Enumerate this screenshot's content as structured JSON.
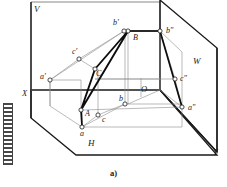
{
  "figure": {
    "caption": "a)",
    "type": "descriptive-geometry-three-plane-projection",
    "planes": [
      {
        "id": "V",
        "label": "V",
        "name": "vertical-frontal-plane",
        "x": 34,
        "y": 12
      },
      {
        "id": "W",
        "label": "W",
        "name": "profile-plane",
        "x": 193,
        "y": 64
      },
      {
        "id": "H",
        "label": "H",
        "name": "horizontal-plane",
        "x": 88,
        "y": 146
      }
    ],
    "axes": [
      {
        "id": "X",
        "label": "X",
        "x": 22,
        "y": 96
      },
      {
        "id": "Y",
        "label": "Y",
        "x": 213,
        "y": 155
      },
      {
        "id": "O",
        "label": "O",
        "name": "origin",
        "x": 141,
        "y": 92
      }
    ],
    "points": [
      {
        "id": "A",
        "label": "A",
        "name": "space-point-a",
        "x": 85,
        "y": 116,
        "vx": 81,
        "vy": 110
      },
      {
        "id": "B",
        "label": "B",
        "name": "space-point-b",
        "x": 133,
        "y": 40,
        "vx": 128,
        "vy": 31
      },
      {
        "id": "C",
        "label": "C",
        "name": "space-point-c",
        "x": 96,
        "y": 76,
        "vx": 95,
        "vy": 69
      },
      {
        "id": "a-prime",
        "label": "a'",
        "name": "frontal-projection-a",
        "x": 40,
        "y": 79,
        "vx": 50,
        "vy": 80
      },
      {
        "id": "b-prime",
        "label": "b'",
        "name": "frontal-projection-b",
        "x": 113,
        "y": 25,
        "vx": 124,
        "vy": 31
      },
      {
        "id": "c-prime",
        "label": "c'",
        "name": "frontal-projection-c",
        "x": 72,
        "y": 54,
        "vx": 79,
        "vy": 59
      },
      {
        "id": "a-dblprime",
        "label": "a\"",
        "name": "profile-projection-a",
        "x": 188,
        "y": 110,
        "vx": 182,
        "vy": 107
      },
      {
        "id": "b-dblprime",
        "label": "b\"",
        "name": "profile-projection-b",
        "x": 166,
        "y": 33,
        "vx": 160,
        "vy": 31
      },
      {
        "id": "c-dblprime",
        "label": "c\"",
        "name": "profile-projection-c",
        "x": 180,
        "y": 81,
        "vx": 175,
        "vy": 79
      },
      {
        "id": "a-lower",
        "label": "a",
        "name": "horizontal-projection-a",
        "x": 80,
        "y": 136,
        "vx": 82,
        "vy": 127
      },
      {
        "id": "b-lower",
        "label": "b",
        "name": "horizontal-projection-b",
        "x": 119,
        "y": 101,
        "vx": 125,
        "vy": 104
      },
      {
        "id": "c-lower",
        "label": "c",
        "name": "horizontal-projection-c",
        "x": 102,
        "y": 122,
        "vx": 98,
        "vy": 115
      }
    ],
    "colors": {
      "line": "#4a4a4a",
      "bold_line": "#111111",
      "text": "#1a1a1a",
      "background": "#ffffff"
    }
  }
}
